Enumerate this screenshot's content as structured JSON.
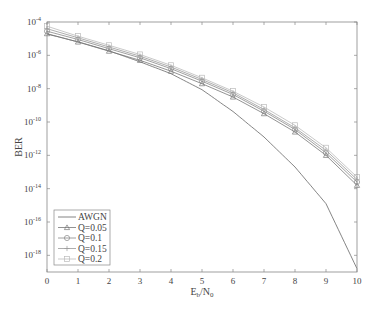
{
  "chart_data": {
    "type": "line",
    "title": "",
    "xlabel": "E_b/N_0",
    "ylabel": "BER",
    "xlim": [
      0,
      10
    ],
    "ylim_log10": [
      -19,
      -4
    ],
    "yscale": "log",
    "grid": false,
    "legend_position": "lower left",
    "x": [
      0,
      1,
      2,
      3,
      4,
      5,
      6,
      7,
      8,
      9,
      10
    ],
    "x_ticks": [
      "0",
      "1",
      "2",
      "3",
      "4",
      "5",
      "6",
      "7",
      "8",
      "9",
      "10"
    ],
    "y_ticks": [
      {
        "exp": -4,
        "label": "10^-4"
      },
      {
        "exp": -6,
        "label": "10^-6"
      },
      {
        "exp": -8,
        "label": "10^-8"
      },
      {
        "exp": -10,
        "label": "10^-10"
      },
      {
        "exp": -12,
        "label": "10^-12"
      },
      {
        "exp": -14,
        "label": "10^-14"
      },
      {
        "exp": -16,
        "label": "10^-16"
      },
      {
        "exp": -18,
        "label": "10^-18"
      }
    ],
    "series": [
      {
        "name": "AWGN",
        "marker": "none",
        "color": "#666666",
        "log10_values": [
          -4.72,
          -5.19,
          -5.73,
          -6.39,
          -7.1,
          -8.06,
          -9.37,
          -10.9,
          -12.7,
          -14.9,
          -18.8
        ]
      },
      {
        "name": "Q=0.05",
        "marker": "triangle",
        "color": "#777777",
        "log10_values": [
          -4.7,
          -5.2,
          -5.75,
          -6.3,
          -6.95,
          -7.7,
          -8.5,
          -9.5,
          -10.6,
          -12.0,
          -13.8
        ]
      },
      {
        "name": "Q=0.1",
        "marker": "circle",
        "color": "#888888",
        "log10_values": [
          -4.55,
          -5.05,
          -5.6,
          -6.15,
          -6.8,
          -7.55,
          -8.35,
          -9.35,
          -10.45,
          -11.85,
          -13.6
        ]
      },
      {
        "name": "Q=0.15",
        "marker": "plus",
        "color": "#999999",
        "log10_values": [
          -4.4,
          -4.95,
          -5.5,
          -6.05,
          -6.7,
          -7.45,
          -8.25,
          -9.25,
          -10.35,
          -11.7,
          -13.45
        ]
      },
      {
        "name": "Q=0.2",
        "marker": "square",
        "color": "#bbbbbb",
        "log10_values": [
          -4.25,
          -4.85,
          -5.4,
          -5.95,
          -6.6,
          -7.35,
          -8.15,
          -9.1,
          -10.2,
          -11.55,
          -13.3
        ]
      }
    ]
  },
  "labels": {
    "ylabel": "BER",
    "xlabel_main": "E",
    "xlabel_sub1": "b",
    "xlabel_mid": "/N",
    "xlabel_sub2": "0"
  },
  "legend": {
    "items": [
      "AWGN",
      "Q=0.05",
      "Q=0.1",
      "Q=0.15",
      "Q=0.2"
    ]
  }
}
